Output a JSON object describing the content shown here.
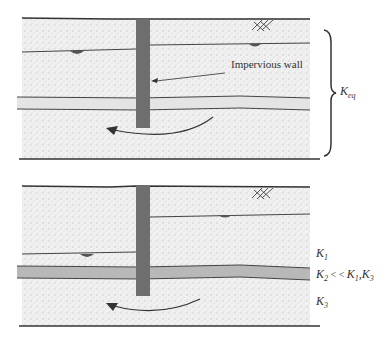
{
  "colors": {
    "sand": "#efefef",
    "line": "#333333",
    "wall": "#6e6e6e",
    "low_k_layer_top": "#e2e2e2",
    "low_k_layer_bottom": "#b4b4b4"
  },
  "top_panel": {
    "wall_label": "Impervious wall",
    "k_eq": {
      "symbol": "K",
      "subscript": "eq"
    }
  },
  "bottom_panel": {
    "k1": {
      "symbol": "K",
      "subscript": "1"
    },
    "k2": {
      "symbol": "K",
      "subscript": "2",
      "relation": " < < ",
      "compare1": "K",
      "compare1_sub": "1",
      "sep": ",",
      "compare2": "K",
      "compare2_sub": "3"
    },
    "k3": {
      "symbol": "K",
      "subscript": "3"
    }
  }
}
